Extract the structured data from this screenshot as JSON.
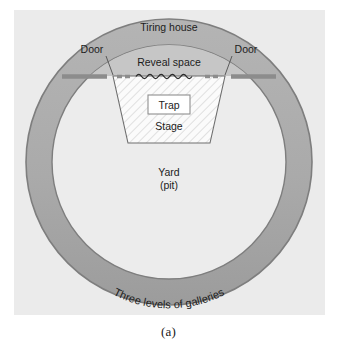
{
  "figure": {
    "caption": "(a)"
  },
  "labels": {
    "tiring_house": "Tiring house",
    "door_left": "Door",
    "door_right": "Door",
    "reveal_space": "Reveal space",
    "trap": "Trap",
    "stage": "Stage",
    "yard_line1": "Yard",
    "yard_line2": "(pit)",
    "galleries": "Three levels of galleries"
  },
  "colors": {
    "page_background": "#ffffff",
    "panel_background": "#ebebeb",
    "gallery_ring_fill": "#a8a8a8",
    "gallery_ring_stroke": "#7d7d7d",
    "yard_fill": "#ececec",
    "tiring_house_fill": "#c9c9c9",
    "stage_fill": "#fbfbfb",
    "stage_hatch": "#cfcfcf",
    "stage_stroke": "#6f6f6f",
    "frons_line": "#8e8e8e",
    "trap_box_fill": "#ffffff",
    "trap_box_stroke": "#909090",
    "text_color": "#1c1c1c",
    "leader_line": "#5a5a5a"
  },
  "geometry": {
    "panel": {
      "x": 14,
      "y": 10,
      "width": 311,
      "height": 305
    },
    "outer_circle": {
      "cx": 169,
      "cy": 162,
      "r": 143
    },
    "inner_circle": {
      "cx": 169,
      "cy": 162,
      "r": 117
    },
    "frons_line_y": 76,
    "stage": {
      "top_left_x": 113,
      "top_right_x": 225,
      "bottom_left_x": 128,
      "bottom_right_x": 210,
      "bottom_y": 143
    },
    "trap_box": {
      "x": 148,
      "y": 95,
      "width": 42,
      "height": 19
    }
  }
}
